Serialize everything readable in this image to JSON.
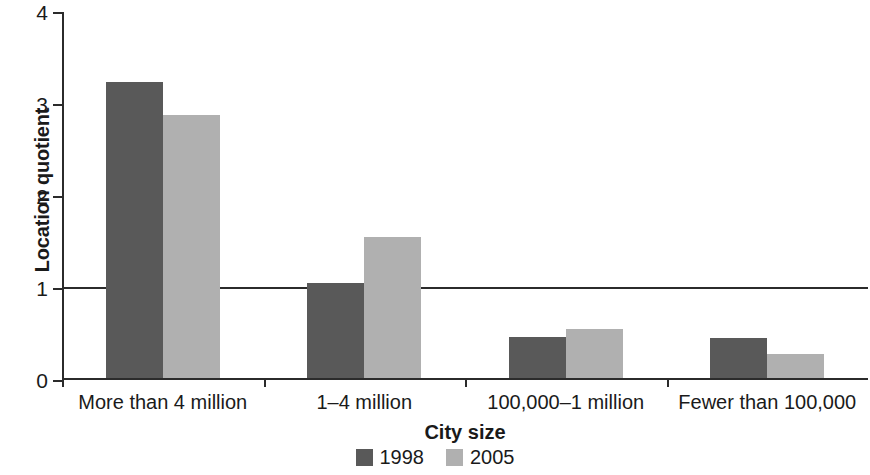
{
  "chart_data": {
    "type": "bar",
    "title": "",
    "subtitle": "",
    "xlabel": "City size",
    "ylabel": "Location quotient",
    "categories": [
      "More than 4 million",
      "1–4 million",
      "100,000–1 million",
      "Fewer than 100,000"
    ],
    "series": [
      {
        "name": "1998",
        "color": "#595959",
        "values": [
          3.22,
          1.03,
          0.45,
          0.44
        ]
      },
      {
        "name": "2005",
        "color": "#b0b0b0",
        "values": [
          2.86,
          1.53,
          0.53,
          0.26
        ]
      }
    ],
    "ylim": [
      0,
      4
    ],
    "yticks": [
      0,
      1,
      2,
      3,
      4
    ],
    "ytick_labels": [
      "0",
      "1",
      "2",
      "3",
      "4"
    ],
    "reference_lines": [
      {
        "value": 1,
        "color": "#2b2b2b"
      }
    ],
    "grid": false,
    "legend_position": "bottom"
  },
  "legend": {
    "items": [
      {
        "label": "1998",
        "color": "#595959"
      },
      {
        "label": "2005",
        "color": "#b0b0b0"
      }
    ]
  },
  "axes": {
    "y_title": "Location quotient",
    "x_title": "City size",
    "y_ticks": [
      "0",
      "1",
      "2",
      "3",
      "4"
    ]
  }
}
